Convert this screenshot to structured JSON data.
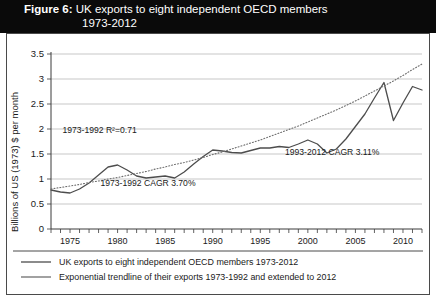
{
  "title": {
    "figure_label": "Figure 6:",
    "line1": "UK exports to eight independent OECD members",
    "line2": "1973-2012"
  },
  "chart_data": {
    "type": "line",
    "title": "UK exports to eight independent OECD members 1973-2012",
    "xlabel": "",
    "ylabel": "Billions of US (1973) $ per month",
    "xlim": [
      1973,
      2012
    ],
    "ylim": [
      0,
      3.5
    ],
    "ytick_labels": [
      "0",
      "0.5",
      "1",
      "1.5",
      "2",
      "2.5",
      "3",
      "3.5"
    ],
    "ytick_values": [
      0,
      0.5,
      1,
      1.5,
      2,
      2.5,
      3,
      3.5
    ],
    "xtick_labels": [
      "1975",
      "1980",
      "1985",
      "1990",
      "1995",
      "2000",
      "2005",
      "2010"
    ],
    "xtick_values": [
      1975,
      1980,
      1985,
      1990,
      1995,
      2000,
      2005,
      2010
    ],
    "minor_xticks_every": 1,
    "grid": true,
    "legend_position": "below-plot",
    "x": [
      1973,
      1974,
      1975,
      1976,
      1977,
      1978,
      1979,
      1980,
      1981,
      1982,
      1983,
      1984,
      1985,
      1986,
      1987,
      1988,
      1989,
      1990,
      1991,
      1992,
      1993,
      1994,
      1995,
      1996,
      1997,
      1998,
      1999,
      2000,
      2001,
      2002,
      2003,
      2004,
      2005,
      2006,
      2007,
      2008,
      2009,
      2010,
      2011,
      2012
    ],
    "series": [
      {
        "name": "UK exports to eight independent OECD members 1973-2012",
        "style": "solid",
        "values": [
          0.78,
          0.74,
          0.72,
          0.8,
          0.92,
          1.08,
          1.24,
          1.28,
          1.18,
          1.06,
          1.02,
          1.04,
          1.06,
          1.02,
          1.14,
          1.3,
          1.45,
          1.58,
          1.56,
          1.53,
          1.52,
          1.57,
          1.62,
          1.62,
          1.65,
          1.63,
          1.7,
          1.78,
          1.7,
          1.52,
          1.6,
          1.8,
          2.05,
          2.3,
          2.62,
          2.93,
          2.17,
          2.52,
          2.85,
          2.78
        ]
      },
      {
        "name": "Exponential trendline of their exports 1973-1992 and extended to 2012",
        "style": "dotted",
        "values": [
          0.8,
          0.83,
          0.86,
          0.89,
          0.93,
          0.96,
          1.0,
          1.03,
          1.07,
          1.11,
          1.15,
          1.2,
          1.24,
          1.29,
          1.33,
          1.38,
          1.43,
          1.49,
          1.54,
          1.6,
          1.66,
          1.72,
          1.78,
          1.85,
          1.92,
          1.99,
          2.06,
          2.14,
          2.22,
          2.3,
          2.38,
          2.47,
          2.56,
          2.66,
          2.76,
          2.86,
          2.96,
          3.07,
          3.19,
          3.3
        ]
      }
    ],
    "annotations": [
      {
        "name": "r-squared",
        "text": "1973-1992 R²=0.71",
        "x": 1974.2,
        "y": 1.93
      },
      {
        "name": "cagr-early",
        "text": "1973-1992 CAGR 3.70%",
        "x": 1978.2,
        "y": 0.86
      },
      {
        "name": "cagr-late",
        "text": "1993-2012 CAGR 3.11%",
        "x": 1997.6,
        "y": 1.48
      }
    ]
  },
  "legend": [
    {
      "swatch": "solid-line",
      "label": "UK exports to eight independent OECD members 1973-2012"
    },
    {
      "swatch": "dotted-line",
      "label": "Exponential trendline of their exports 1973-1992 and extended to 2012"
    }
  ]
}
